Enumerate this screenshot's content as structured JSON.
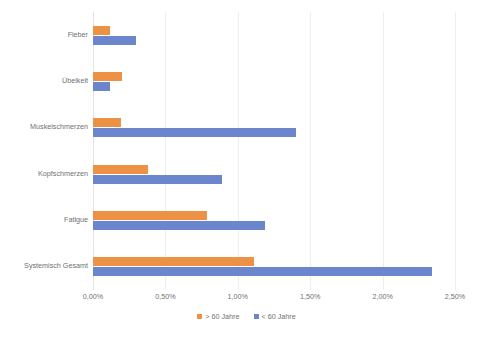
{
  "chart_data": {
    "type": "bar",
    "orientation": "horizontal",
    "title": "",
    "subtitle": "",
    "xlabel": "",
    "ylabel": "",
    "xlim": [
      0,
      2.5
    ],
    "grid": true,
    "legend_position": "bottom",
    "categories": [
      "Fieber",
      "Übelkeit",
      "Muskelschmerzen",
      "Kopfschmerzen",
      "Fatigue",
      "Systemisch Gesamt"
    ],
    "series": [
      {
        "name": "> 60 Jahre",
        "color": "#ED9144",
        "values": [
          0.12,
          0.2,
          0.19,
          0.38,
          0.79,
          1.11
        ]
      },
      {
        "name": "< 60 Jahre",
        "color": "#6C86CE",
        "values": [
          0.3,
          0.12,
          1.4,
          0.89,
          1.19,
          2.34
        ]
      }
    ],
    "xticks": [
      0,
      0.5,
      1.0,
      1.5,
      2.0,
      2.5
    ],
    "xticklabels": [
      "0,00%",
      "0,50%",
      "1,00%",
      "1,50%",
      "2,00%",
      "2,50%"
    ]
  },
  "legend": {
    "items": [
      {
        "label": "> 60 Jahre",
        "color": "#ED9144"
      },
      {
        "label": "< 60 Jahre",
        "color": "#6C86CE"
      }
    ]
  }
}
